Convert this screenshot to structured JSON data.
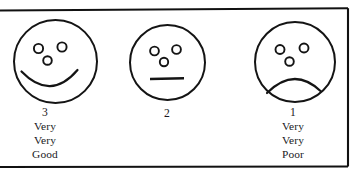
{
  "figure": {
    "name": "three-point-faces-rating-scale",
    "border_color": "#111111",
    "ink_color": "#141414",
    "background": "#ffffff"
  },
  "faces": [
    {
      "id": "happy-face",
      "expression": "smile",
      "mouth": "upward-curve",
      "score": "3",
      "lines": [
        "Very",
        "Very",
        "Good"
      ]
    },
    {
      "id": "neutral-face",
      "expression": "neutral",
      "mouth": "straight-line",
      "score": "2",
      "lines": []
    },
    {
      "id": "sad-face",
      "expression": "frown",
      "mouth": "downward-curve",
      "score": "1",
      "lines": [
        "Very",
        "Very",
        "Poor"
      ]
    }
  ]
}
